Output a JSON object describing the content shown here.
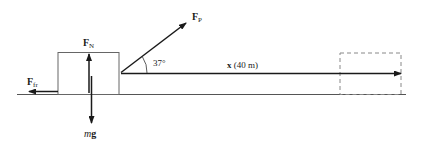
{
  "diagram": {
    "forces": {
      "normal": {
        "symbol": "F",
        "subscript": "N"
      },
      "friction": {
        "symbol": "F",
        "subscript": "fr"
      },
      "pull": {
        "symbol": "F",
        "subscript": "P"
      },
      "weight": {
        "italic": "m",
        "bold": "g"
      }
    },
    "angle_label": "37°",
    "displacement_label": {
      "symbol": "x",
      "value": " (40 m)"
    },
    "colors": {
      "line": "#1a1a1a",
      "ground": "#555555",
      "box": "#666666",
      "ghost_box": "#888888"
    }
  }
}
